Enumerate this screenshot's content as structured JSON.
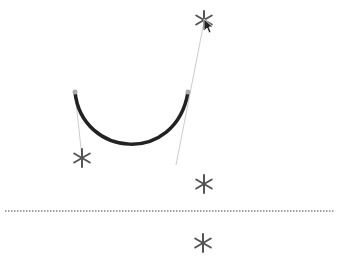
{
  "canvas": {
    "width": 338,
    "height": 263,
    "background": "#ffffff"
  },
  "curve": {
    "start": [
      75,
      92
    ],
    "control1": [
      82,
      158
    ],
    "control2": [
      176,
      165
    ],
    "end": [
      188,
      92
    ],
    "stroke": "#222222",
    "width": 3.5
  },
  "handles": [
    {
      "from": [
        75,
        92
      ],
      "to": [
        82,
        158
      ]
    },
    {
      "from": [
        204,
        22
      ],
      "to": [
        176,
        165
      ]
    }
  ],
  "handle_color": "#cccccc",
  "endpoints": [
    [
      75,
      92
    ],
    [
      188,
      92
    ]
  ],
  "endpoint_color": "#aaaaaa",
  "stars": [
    {
      "name": "star-top",
      "x": 204,
      "y": 20
    },
    {
      "name": "star-left",
      "x": 82,
      "y": 158
    },
    {
      "name": "star-bottom-right",
      "x": 204,
      "y": 184
    },
    {
      "name": "star-below-line",
      "x": 203,
      "y": 243
    }
  ],
  "star_color": "#555555",
  "divider": {
    "y": 211,
    "x1": 5,
    "x2": 335,
    "color": "#444444"
  },
  "cursor": {
    "x": 204,
    "y": 19
  }
}
